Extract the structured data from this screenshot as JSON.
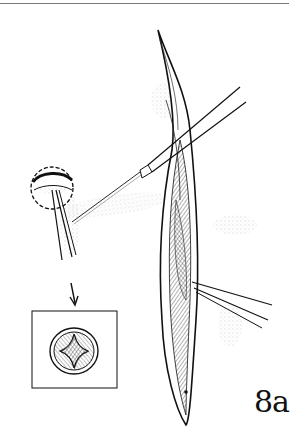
{
  "figure": {
    "label": "8a"
  },
  "colors": {
    "ink": "#111111",
    "rule": "#777777",
    "stipple": "#999999",
    "background": "#ffffff"
  },
  "elements": {
    "top_rule": "horizontal-divider",
    "inset": "inset-box-star-opening",
    "arrow": "down-arrow"
  }
}
